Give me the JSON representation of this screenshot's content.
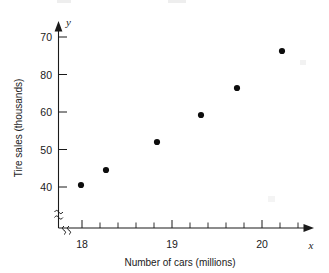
{
  "chart_data": {
    "type": "scatter",
    "title": "",
    "xlabel": "Number of cars (millions)",
    "ylabel": "Tire sales (thousands)",
    "x_var": "x",
    "y_var": "y",
    "xlim": [
      17.75,
      20.6
    ],
    "ylim": [
      36,
      74
    ],
    "grid": false,
    "legend": null,
    "x_ticks": [
      {
        "value": 18,
        "label": "18"
      },
      {
        "value": 19,
        "label": "19"
      },
      {
        "value": 20,
        "label": "20"
      }
    ],
    "x_minor_tick_step": 0.2,
    "y_ticks": [
      {
        "value": 70,
        "label": "70"
      },
      {
        "value": 65,
        "label": "80"
      },
      {
        "value": 60,
        "label": "60"
      },
      {
        "value": 55,
        "label": "50"
      },
      {
        "value": 50,
        "label": "40"
      }
    ],
    "axis_break": {
      "x_axis": true,
      "y_axis": true,
      "symbol": "squiggle"
    },
    "x": [
      18.0,
      18.3,
      18.85,
      19.35,
      19.75,
      20.25
    ],
    "y": [
      40,
      44.5,
      52,
      59.3,
      67,
      73
    ],
    "points": [
      {
        "x": 18.0,
        "y": 40
      },
      {
        "x": 18.3,
        "y": 44.5
      },
      {
        "x": 18.85,
        "y": 52
      },
      {
        "x": 19.35,
        "y": 59.3
      },
      {
        "x": 19.75,
        "y": 67
      },
      {
        "x": 20.25,
        "y": 73
      }
    ],
    "point_pixels": [
      {
        "px": 81,
        "py": 185
      },
      {
        "px": 106,
        "py": 170
      },
      {
        "px": 157,
        "py": 142
      },
      {
        "px": 201,
        "py": 115
      },
      {
        "px": 237,
        "py": 88
      },
      {
        "px": 282,
        "py": 51
      }
    ]
  }
}
